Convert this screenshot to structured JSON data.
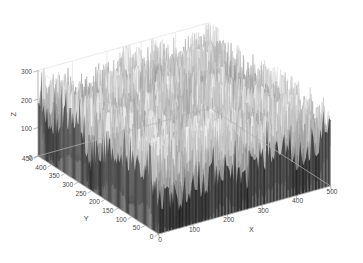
{
  "figure": {
    "background_color": "#ffffff",
    "width": 363,
    "height": 263,
    "grid_color": "#dcdcdc",
    "axis_color": "#b4b4b4",
    "text_color": "#4a4a4a"
  },
  "chart_data": {
    "type": "surface",
    "title": "",
    "subtitle": "",
    "xlabel": "X",
    "ylabel": "Y",
    "zlabel": "Z",
    "xlim": [
      0,
      500
    ],
    "ylim": [
      0,
      450
    ],
    "zlim": [
      0,
      300
    ],
    "xticks": [
      0,
      100,
      200,
      300,
      400,
      500
    ],
    "yticks": [
      0,
      50,
      100,
      150,
      200,
      250,
      300,
      350,
      400,
      450
    ],
    "zticks": [
      0,
      100,
      200,
      300
    ],
    "xtick_labels": [
      "0",
      "100",
      "200",
      "300",
      "400",
      "500"
    ],
    "ytick_labels": [
      "0",
      "50",
      "100",
      "150",
      "200",
      "250",
      "300",
      "350",
      "400",
      "450"
    ],
    "ztick_labels": [
      "0",
      "100",
      "200",
      "300"
    ],
    "grid": true,
    "legend": "none",
    "colormap": "gray",
    "shading": "interp",
    "view_azimuth": -37.5,
    "view_elevation": 30,
    "value_mean": 95,
    "value_min": 0,
    "value_max": 300,
    "nx": 120,
    "ny": 108
  },
  "axes": {
    "z_ticks_labels": [
      "300",
      "200",
      "100",
      "0"
    ],
    "y_ticks_labels": [
      "450",
      "400",
      "350",
      "300",
      "250",
      "200",
      "150",
      "100",
      "50",
      "0"
    ],
    "x_ticks_labels": [
      "0",
      "100",
      "200",
      "300",
      "400",
      "500"
    ],
    "x_title": "X",
    "y_title": "Y",
    "z_title": "Z"
  }
}
